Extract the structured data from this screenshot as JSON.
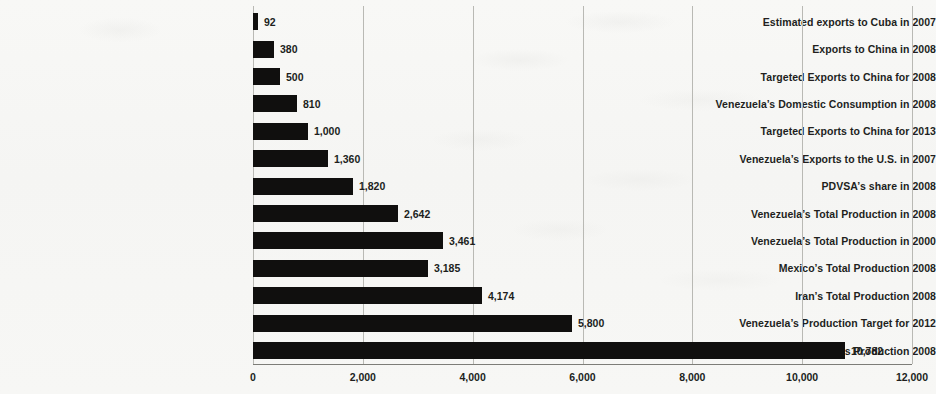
{
  "chart_data": {
    "type": "bar",
    "orientation": "horizontal",
    "title": "",
    "subtitle": "",
    "xlabel": "",
    "ylabel": "",
    "grid": true,
    "legend": false,
    "xlim": [
      0,
      12000
    ],
    "xticks": [
      0,
      2000,
      4000,
      6000,
      8000,
      10000,
      12000
    ],
    "xtick_labels": [
      "0",
      "2,000",
      "4,000",
      "6,000",
      "8,000",
      "10,000",
      "12,000"
    ],
    "categories": [
      "Estimated exports to Cuba in 2007",
      "Exports to China in 2008",
      "Targeted Exports to China for 2008",
      "Venezuela’s Domestic Consumption in 2008",
      "Targeted Exports to China for 2013",
      "Venezuela’s Exports to the U.S. in 2007",
      "PDVSA’s share in 2008",
      "Venezuela’s Total Production in 2008",
      "Venezuela’s Total Production in 2000",
      "Mexico’s Total Production 2008",
      "Iran’s Total Production 2008",
      "Venezuela’s Production Target for 2012",
      "Saudi Arabia’s Production 2008"
    ],
    "values": [
      92,
      380,
      500,
      810,
      1000,
      1360,
      1820,
      2642,
      3461,
      3185,
      4174,
      5800,
      10782
    ],
    "value_labels": [
      "92",
      "380",
      "500",
      "810",
      "1,000",
      "1,360",
      "1,820",
      "2,642",
      "3,461",
      "3,185",
      "4,174",
      "5,800",
      "10,782"
    ],
    "bar_color": "#100f0e",
    "gridline_color": "#b9b9b4",
    "axis_color": "#7d7d78",
    "background_color": "#f6f6f4"
  },
  "layout": {
    "plot_left": 253,
    "plot_right": 912,
    "plot_top": 6,
    "plot_bottom": 364,
    "row_pitch": 27.4,
    "bar_height": 17,
    "label_column_right": 245,
    "tick_label_y": 372
  }
}
